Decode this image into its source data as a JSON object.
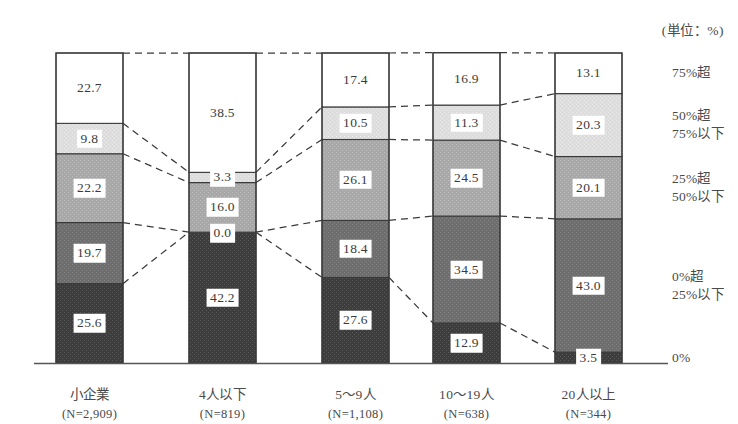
{
  "unit_note": "(単位：%)",
  "chart_data": {
    "type": "bar",
    "subtype": "stacked-100-percent",
    "title": "",
    "subtitle": "",
    "unit_note": "(単位：%)",
    "xlabel": "",
    "ylabel": "",
    "ylim": [
      0,
      100
    ],
    "grid": false,
    "legend_position": "right",
    "orientation": "vertical",
    "stack_order": "bottom-to-top",
    "categories": [
      "小企業",
      "4人以下",
      "5〜9人",
      "10〜19人",
      "20人以上"
    ],
    "category_counts": [
      "(N=2,909)",
      "(N=819)",
      "(N=1,108)",
      "(N=638)",
      "(N=344)"
    ],
    "series": [
      {
        "name": "0%",
        "color": "#3d3d3d",
        "values": [
          25.6,
          42.2,
          27.6,
          12.9,
          3.5
        ]
      },
      {
        "name": "0%超 25%以下",
        "color": "#6e6e6e",
        "values": [
          19.7,
          0.0,
          18.4,
          34.5,
          43.0
        ]
      },
      {
        "name": "25%超 50%以下",
        "color": "#a8a8a8",
        "values": [
          22.2,
          16.0,
          26.1,
          24.5,
          20.1
        ]
      },
      {
        "name": "50%超 75%以下",
        "color": "#dcdcdc",
        "values": [
          9.8,
          3.3,
          10.5,
          11.3,
          20.3
        ]
      },
      {
        "name": "75%超",
        "color": "#ffffff",
        "values": [
          22.7,
          38.5,
          17.4,
          16.9,
          13.1
        ]
      }
    ],
    "legend_entries": [
      {
        "line1": "75%超",
        "line2": ""
      },
      {
        "line1": "50%超",
        "line2": "75%以下"
      },
      {
        "line1": "25%超",
        "line2": "50%以下"
      },
      {
        "line1": "0%超",
        "line2": "25%以下"
      },
      {
        "line1": "0%",
        "line2": ""
      }
    ],
    "data_labels": [
      [
        "25.6",
        "19.7",
        "22.2",
        "9.8",
        "22.7"
      ],
      [
        "42.2",
        "0.0",
        "16.0",
        "3.3",
        "38.5"
      ],
      [
        "27.6",
        "18.4",
        "26.1",
        "10.5",
        "17.4"
      ],
      [
        "12.9",
        "34.5",
        "24.5",
        "11.3",
        "16.9"
      ],
      [
        "3.5",
        "43.0",
        "20.1",
        "20.3",
        "13.1"
      ]
    ],
    "connector_lines": "dashed",
    "axis_line_color": "#555555"
  }
}
